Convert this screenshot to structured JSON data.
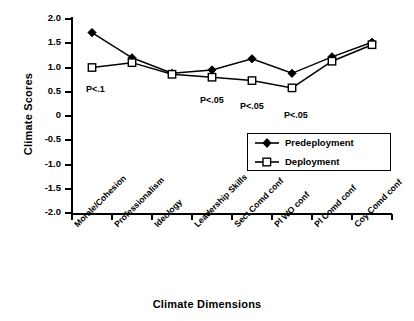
{
  "chart_data": {
    "type": "line",
    "title": "",
    "xlabel": "Climate Dimensions",
    "ylabel": "Climate Scores",
    "ylim": [
      -2.0,
      2.0
    ],
    "grid": false,
    "legend_position": "inside-right",
    "categories": [
      "Morale/Cohesion",
      "Professionalism",
      "Ideology",
      "Leadership Skills",
      "Sect Comd conf",
      "Pl WO conf",
      "Pl Comd conf",
      "Coy Comd conf"
    ],
    "ytick_labels": [
      "2.0",
      "1.5",
      "1.0",
      "0.5",
      "0",
      "-0.5",
      "-1.0",
      "-1.5",
      "-2.0"
    ],
    "ytick_values": [
      2.0,
      1.5,
      1.0,
      0.5,
      0,
      -0.5,
      -1.0,
      -1.5,
      -2.0
    ],
    "series": [
      {
        "name": "Predeployment",
        "marker": "filled-diamond",
        "values": [
          1.72,
          1.2,
          0.88,
          0.95,
          1.18,
          0.88,
          1.22,
          1.52
        ]
      },
      {
        "name": "Deployment",
        "marker": "open-square",
        "values": [
          1.0,
          1.1,
          0.86,
          0.8,
          0.73,
          0.58,
          1.13,
          1.47
        ]
      }
    ],
    "annotations": [
      {
        "text": "P<.1",
        "category": "Morale/Cohesion"
      },
      {
        "text": "P<.05",
        "category": "Leadership Skills"
      },
      {
        "text": "P<.05",
        "category": "Sect Comd conf"
      },
      {
        "text": "P<.05",
        "category": "Pl WO conf"
      }
    ]
  },
  "legend": {
    "items": [
      {
        "label": "Predeployment"
      },
      {
        "label": "Deployment"
      }
    ]
  },
  "axes": {
    "y_title": "Climate Scores",
    "x_title": "Climate Dimensions"
  },
  "colors": {
    "line": "#000000",
    "background": "#ffffff",
    "marker_fill_predeployment": "#000000",
    "marker_fill_deployment": "#ffffff"
  }
}
